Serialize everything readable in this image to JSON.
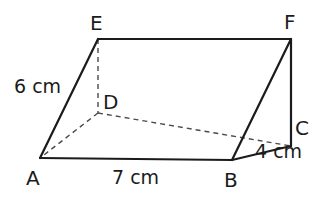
{
  "figure": {
    "kind": "triangular-prism-diagram",
    "stroke_color": "#1b1b1b",
    "dashed_color": "#4a4a4a",
    "background_color": "#ffffff",
    "solid_stroke_width": 2.2,
    "dashed_stroke_width": 1.4,
    "vertices": {
      "A": {
        "label": "A",
        "x": 40,
        "y": 158
      },
      "B": {
        "label": "B",
        "x": 232,
        "y": 160
      },
      "C": {
        "label": "C",
        "x": 291,
        "y": 146
      },
      "D": {
        "label": "D",
        "x": 98,
        "y": 113
      },
      "E": {
        "label": "E",
        "x": 98,
        "y": 39
      },
      "F": {
        "label": "F",
        "x": 291,
        "y": 39
      }
    },
    "solid_edges": [
      {
        "name": "edge-A-E",
        "from": "A",
        "to": "E"
      },
      {
        "name": "edge-E-F",
        "from": "E",
        "to": "F"
      },
      {
        "name": "edge-F-C",
        "from": "F",
        "to": "C"
      },
      {
        "name": "edge-C-B",
        "from": "C",
        "to": "B"
      },
      {
        "name": "edge-B-A",
        "from": "B",
        "to": "A"
      },
      {
        "name": "edge-B-F",
        "from": "B",
        "to": "F"
      }
    ],
    "dashed_edges": [
      {
        "name": "edge-E-D",
        "from": "E",
        "to": "D"
      },
      {
        "name": "edge-D-A",
        "from": "D",
        "to": "A"
      },
      {
        "name": "edge-D-C",
        "from": "D",
        "to": "C"
      }
    ],
    "measurements": [
      {
        "name": "measure-AE",
        "text": "6 cm",
        "edge": "A-E"
      },
      {
        "name": "measure-AB",
        "text": "7 cm",
        "edge": "A-B"
      },
      {
        "name": "measure-BC",
        "text": "4 cm",
        "edge": "B-C"
      }
    ]
  }
}
